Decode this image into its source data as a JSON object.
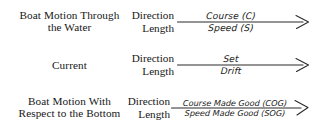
{
  "diagram": {
    "line_color": "#2b2b2b",
    "text_color": "#161616",
    "background": "#ffffff",
    "labels": {
      "direction": "Direction",
      "length": "Length"
    },
    "rows": [
      {
        "name": "boat-motion-through-water",
        "left_label_lines": [
          "Boat Motion Through",
          "the Water"
        ],
        "direction_label": "Direction",
        "length_label": "Length",
        "above_arrow": "Course (C)",
        "below_arrow": "Speed (S)"
      },
      {
        "name": "current",
        "left_label_lines": [
          "Current"
        ],
        "direction_label": "Direction",
        "length_label": "Length",
        "above_arrow": "Set",
        "below_arrow": "Drift"
      },
      {
        "name": "boat-motion-respect-to-bottom",
        "left_label_lines": [
          "Boat Motion With",
          "Respect to the Bottom"
        ],
        "direction_label": "Direction",
        "length_label": "Length",
        "above_arrow": "Course Made Good (COG)",
        "below_arrow": "Speed Made Good (SOG)"
      }
    ]
  }
}
